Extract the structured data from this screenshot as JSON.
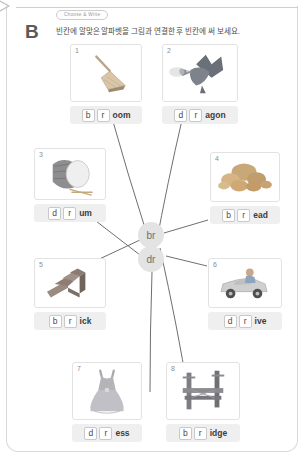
{
  "header": {
    "section_letter": "B",
    "tag": "Choose & Write",
    "instruction": "빈칸에 알맞은 알파벳을 그림과 연결한 후 빈칸에 써 보세요."
  },
  "center": {
    "bubbles": [
      {
        "id": "br",
        "label": "br"
      },
      {
        "id": "dr",
        "label": "dr"
      }
    ]
  },
  "cards": [
    {
      "number": "1",
      "word": "broom",
      "icon": "broom-icon",
      "slot1": "b",
      "slot2": "r",
      "rest": "oom"
    },
    {
      "number": "2",
      "word": "dragon",
      "icon": "dragon-icon",
      "slot1": "d",
      "slot2": "r",
      "rest": "agon"
    },
    {
      "number": "3",
      "word": "drum",
      "icon": "drum-icon",
      "slot1": "d",
      "slot2": "r",
      "rest": "um"
    },
    {
      "number": "4",
      "word": "bread",
      "icon": "bread-icon",
      "slot1": "b",
      "slot2": "r",
      "rest": "ead"
    },
    {
      "number": "5",
      "word": "brick",
      "icon": "brick-icon",
      "slot1": "b",
      "slot2": "r",
      "rest": "ick"
    },
    {
      "number": "6",
      "word": "drive",
      "icon": "drive-icon",
      "slot1": "d",
      "slot2": "r",
      "rest": "ive"
    },
    {
      "number": "7",
      "word": "dress",
      "icon": "dress-icon",
      "slot1": "d",
      "slot2": "r",
      "rest": "ess"
    },
    {
      "number": "8",
      "word": "bridge",
      "icon": "bridge-icon",
      "slot1": "b",
      "slot2": "r",
      "rest": "idge"
    }
  ],
  "colors": {
    "slot_border": "#c9c9c9",
    "answer_bg": "#efefef",
    "bubble_bg": "#e3e3e3",
    "line": "#6f6f6f",
    "text": "#4a4a4a"
  }
}
